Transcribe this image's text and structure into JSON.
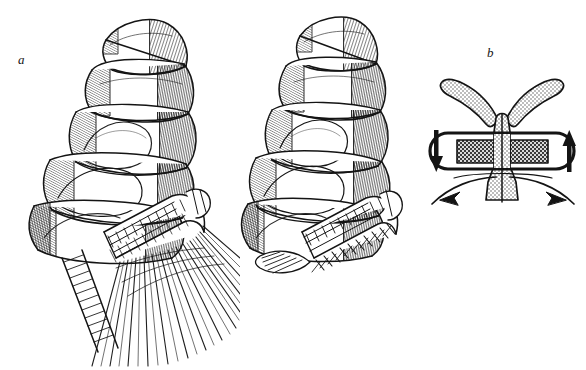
{
  "figure": {
    "kind": "scientific-line-drawing",
    "background_color": "#ffffff",
    "ink_color": "#141414",
    "width": 586,
    "height": 370,
    "panels": [
      {
        "id": "a",
        "label": "a",
        "description": "Segmented appendage rendered as an ink line drawing with dense hatching; distal comb-like segment bearing a fan of long, straight setae spread wide open.",
        "style": "stipple-and-hatch line art",
        "setae_state": "expanded"
      },
      {
        "id": "b",
        "label": "b",
        "description": "Same segmented appendage with the comb-like distal segment bearing short setae folded flat against the margin.",
        "style": "stipple-and-hatch line art",
        "setae_state": "collapsed"
      },
      {
        "id": "c",
        "label": "c",
        "description": "Schematic diagram of the mechanism: a Y-shaped stippled stem spreading into two upward arms, crossing a horizontal stadium-shaped bar filled with a dense checkered pattern on both sides of the stem.",
        "style": "schematic with solid arrows",
        "arrows": [
          {
            "name": "left-vertical-arrow",
            "direction": "down",
            "position": "left of bar"
          },
          {
            "name": "right-vertical-arrow",
            "direction": "up",
            "position": "right of bar"
          },
          {
            "name": "left-curved-arrow",
            "direction": "up-left",
            "position": "below bar, left"
          },
          {
            "name": "right-curved-arrow",
            "direction": "down-right",
            "position": "below bar, right"
          }
        ],
        "elements": [
          {
            "name": "stippled-y-stem",
            "fill": "stipple"
          },
          {
            "name": "horizontal-bar",
            "fill": "checkered",
            "shape": "stadium"
          },
          {
            "name": "basal-trapezoid",
            "fill": "stipple"
          }
        ]
      }
    ]
  }
}
